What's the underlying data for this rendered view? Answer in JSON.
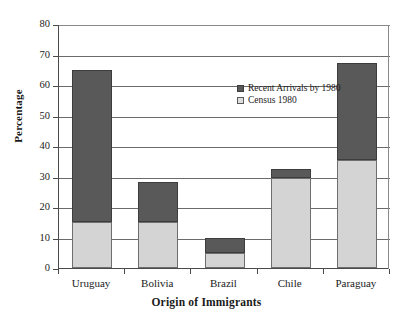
{
  "chart_data": {
    "type": "bar",
    "subtype": "stacked-vertical",
    "title": "",
    "xlabel": "Origin of Immigrants",
    "ylabel": "Percentage",
    "categories": [
      "Uruguay",
      "Bolivia",
      "Brazil",
      "Chile",
      "Paraguay"
    ],
    "series": [
      {
        "name": "Census 1980",
        "color": "#d4d4d4",
        "values": [
          15,
          15,
          5,
          29.5,
          35.5
        ]
      },
      {
        "name": "Recent Arrivals by 1980",
        "color": "#595959",
        "values": [
          50,
          13.2,
          5,
          3,
          31.7
        ]
      }
    ],
    "stack_totals": [
      65,
      28.2,
      10,
      32.5,
      67.2
    ],
    "stack_order": [
      "Census 1980",
      "Recent Arrivals by 1980"
    ],
    "ylim": [
      0,
      80
    ],
    "ytick_step": 10,
    "yticks": [
      80,
      70,
      60,
      50,
      40,
      30,
      20,
      10,
      0
    ],
    "ytick_labels": [
      "80",
      "70",
      "60",
      "50",
      "40",
      "30",
      "20",
      "10",
      "0"
    ],
    "grid": "horizontal",
    "legend_position": "inside-top-center",
    "legend": [
      {
        "label": "Recent Arrivals by 1980",
        "swatch": "recent"
      },
      {
        "label": "Census 1980",
        "swatch": "census"
      }
    ]
  }
}
